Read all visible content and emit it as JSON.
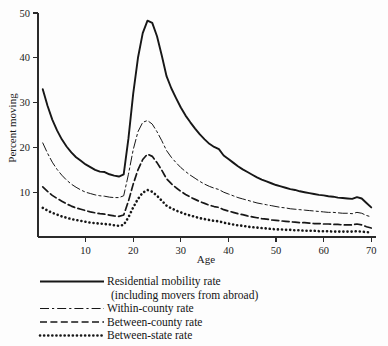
{
  "chart_data": {
    "type": "line",
    "title": "",
    "xlabel": "Age",
    "ylabel": "Percent moving",
    "xlim": [
      0,
      71
    ],
    "ylim": [
      0,
      50
    ],
    "xticks": [
      10,
      20,
      30,
      40,
      50,
      60,
      70
    ],
    "yticks": [
      10,
      20,
      30,
      40,
      50
    ],
    "grid": false,
    "legend_position": "below-plot",
    "x": [
      1,
      2,
      3,
      4,
      5,
      6,
      7,
      8,
      9,
      10,
      11,
      12,
      13,
      14,
      15,
      16,
      17,
      18,
      19,
      20,
      21,
      22,
      23,
      24,
      25,
      26,
      27,
      28,
      29,
      30,
      31,
      32,
      33,
      34,
      35,
      36,
      37,
      38,
      39,
      40,
      41,
      42,
      43,
      44,
      45,
      46,
      47,
      48,
      49,
      50,
      51,
      52,
      53,
      54,
      55,
      56,
      57,
      58,
      59,
      60,
      61,
      62,
      63,
      64,
      65,
      66,
      67,
      68,
      69,
      70
    ],
    "series": [
      {
        "name": "Residential mobility rate (including movers from abroad)",
        "style": "solid",
        "values": [
          33.0,
          29.3,
          26.2,
          23.8,
          21.8,
          20.2,
          18.9,
          17.8,
          17.0,
          16.2,
          15.6,
          15.0,
          14.6,
          14.5,
          14.0,
          13.7,
          13.5,
          14.0,
          22.0,
          32.0,
          40.0,
          45.5,
          48.3,
          47.8,
          44.8,
          40.5,
          35.9,
          33.2,
          31.0,
          28.9,
          27.1,
          25.6,
          24.2,
          22.9,
          21.8,
          20.8,
          20.1,
          19.6,
          18.2,
          17.4,
          16.6,
          15.8,
          15.1,
          14.5,
          13.9,
          13.3,
          12.8,
          12.4,
          12.0,
          11.6,
          11.3,
          11.0,
          10.7,
          10.5,
          10.2,
          10.0,
          9.8,
          9.6,
          9.4,
          9.3,
          9.1,
          9.0,
          8.8,
          8.7,
          8.6,
          8.5,
          8.9,
          8.6,
          7.6,
          6.6
        ]
      },
      {
        "name": "Within-county rate",
        "style": "dash-dot",
        "values": [
          21.0,
          18.7,
          16.7,
          15.1,
          13.8,
          12.7,
          11.8,
          11.1,
          10.5,
          10.0,
          9.7,
          9.4,
          9.2,
          9.1,
          8.9,
          8.8,
          8.8,
          9.2,
          14.0,
          19.5,
          23.5,
          25.6,
          26.0,
          25.2,
          23.5,
          21.5,
          19.3,
          17.8,
          16.6,
          15.5,
          14.6,
          13.8,
          13.1,
          12.4,
          11.8,
          11.3,
          10.9,
          10.6,
          10.0,
          9.6,
          9.2,
          8.8,
          8.5,
          8.2,
          7.9,
          7.6,
          7.4,
          7.2,
          7.0,
          6.8,
          6.6,
          6.5,
          6.3,
          6.2,
          6.1,
          6.0,
          5.9,
          5.8,
          5.7,
          5.6,
          5.5,
          5.5,
          5.4,
          5.3,
          5.3,
          5.2,
          5.5,
          5.3,
          4.8,
          4.5
        ]
      },
      {
        "name": "Between-county rate",
        "style": "dashed",
        "values": [
          11.2,
          10.2,
          9.3,
          8.6,
          8.0,
          7.4,
          6.9,
          6.5,
          6.2,
          5.9,
          5.6,
          5.4,
          5.2,
          5.1,
          4.9,
          4.7,
          4.6,
          4.9,
          8.0,
          11.8,
          15.0,
          17.3,
          18.5,
          18.0,
          16.6,
          14.9,
          13.0,
          11.9,
          11.0,
          10.2,
          9.5,
          8.9,
          8.4,
          7.9,
          7.5,
          7.1,
          6.8,
          6.6,
          6.1,
          5.8,
          5.5,
          5.2,
          5.0,
          4.7,
          4.5,
          4.3,
          4.1,
          4.0,
          3.8,
          3.7,
          3.6,
          3.5,
          3.4,
          3.3,
          3.2,
          3.2,
          3.1,
          3.0,
          3.0,
          2.9,
          2.9,
          2.8,
          2.8,
          2.7,
          2.7,
          2.7,
          2.9,
          2.7,
          2.3,
          2.0
        ]
      },
      {
        "name": "Between-state rate",
        "style": "dotted",
        "values": [
          6.5,
          5.9,
          5.4,
          5.0,
          4.6,
          4.3,
          4.0,
          3.8,
          3.6,
          3.4,
          3.2,
          3.1,
          3.0,
          2.9,
          2.8,
          2.6,
          2.5,
          2.7,
          4.4,
          6.6,
          8.5,
          9.9,
          10.5,
          10.1,
          9.2,
          8.1,
          7.0,
          6.4,
          5.9,
          5.5,
          5.1,
          4.8,
          4.5,
          4.2,
          4.0,
          3.8,
          3.6,
          3.5,
          3.2,
          3.0,
          2.8,
          2.6,
          2.5,
          2.3,
          2.2,
          2.1,
          2.0,
          1.9,
          1.8,
          1.7,
          1.7,
          1.6,
          1.6,
          1.5,
          1.5,
          1.4,
          1.4,
          1.4,
          1.3,
          1.3,
          1.3,
          1.2,
          1.2,
          1.2,
          1.2,
          1.2,
          1.3,
          1.2,
          1.1,
          1.0
        ]
      }
    ]
  },
  "axis": {
    "y_title": "Percent moving",
    "x_title": "Age",
    "y_tick_labels": [
      "50",
      "40",
      "30",
      "20",
      "10"
    ],
    "x_tick_labels": [
      "10",
      "20",
      "30",
      "40",
      "50",
      "60",
      "70"
    ]
  },
  "legend": {
    "entries": [
      {
        "label_line1": "Residential mobility rate",
        "label_line2": "(including movers from abroad)",
        "style": "solid"
      },
      {
        "label_line1": "Within-county rate",
        "label_line2": "",
        "style": "dash-dot"
      },
      {
        "label_line1": "Between-county rate",
        "label_line2": "",
        "style": "dashed"
      },
      {
        "label_line1": "Between-state rate",
        "label_line2": "",
        "style": "dotted"
      }
    ]
  },
  "colors": {
    "ink": "#171717",
    "background": "#fdfdfd"
  }
}
